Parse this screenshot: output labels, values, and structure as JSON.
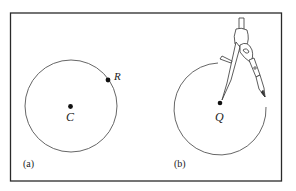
{
  "figure": {
    "panel_a": {
      "label": "(a)",
      "center_label": "C",
      "point_label": "R",
      "description": "Circle with center C and point R on the circle"
    },
    "panel_b": {
      "label": "(b)",
      "center_label": "Q",
      "description": "Compass drawing a circle centered at Q"
    },
    "colors": {
      "stroke": "#3a3a3a",
      "frame": "#2a2a2a",
      "background": "#ffffff"
    }
  }
}
